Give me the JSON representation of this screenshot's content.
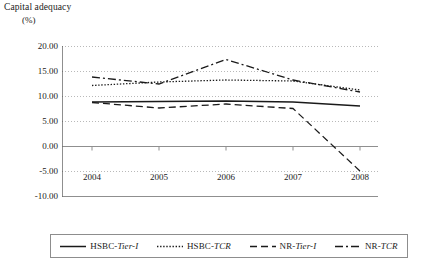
{
  "chart_data": {
    "type": "line",
    "title": "Capital adequacy",
    "subtitle": "(%)",
    "xlabel": "",
    "ylabel": "Capital adequacy (%)",
    "unit": "(%)",
    "categories": [
      "2004",
      "2005",
      "2006",
      "2007",
      "2008"
    ],
    "x": [
      2004,
      2005,
      2006,
      2007,
      2008
    ],
    "ylim": [
      -10.0,
      20.0
    ],
    "ytick_values": [
      20.0,
      15.0,
      10.0,
      5.0,
      0.0,
      -5.0,
      -10.0
    ],
    "ytick_labels": [
      "20.00",
      "15.00",
      "10.00",
      "5.00",
      "0.00",
      "-5.00",
      "-10.00"
    ],
    "grid": true,
    "grid_style": "dotted",
    "legend_position": "bottom",
    "series": [
      {
        "name": "HSBC-Tier-I",
        "name_prefix": "HSBC-",
        "name_italic": "Tier-I",
        "style": "solid",
        "color": "#1a1a1a",
        "values": [
          8.8,
          8.9,
          9.0,
          8.8,
          8.0
        ]
      },
      {
        "name": "HSBC-TCR",
        "name_prefix": "HSBC-",
        "name_italic": "TCR",
        "style": "dotted",
        "color": "#1a1a1a",
        "values": [
          12.1,
          12.8,
          13.2,
          13.0,
          11.2
        ]
      },
      {
        "name": "NR-Tier-I",
        "name_prefix": "NR-",
        "name_italic": "Tier-I",
        "style": "dashed",
        "color": "#1a1a1a",
        "values": [
          8.7,
          7.6,
          8.4,
          7.5,
          -5.0
        ]
      },
      {
        "name": "NR-TCR",
        "name_prefix": "NR-",
        "name_italic": "TCR",
        "style": "dashdot",
        "color": "#1a1a1a",
        "values": [
          13.8,
          12.4,
          17.3,
          13.2,
          10.8
        ]
      }
    ]
  },
  "legend": {
    "entries": [
      {
        "prefix": "HSBC-",
        "italic": "Tier-I",
        "style": "solid"
      },
      {
        "prefix": "HSBC-",
        "italic": "TCR",
        "style": "dotted"
      },
      {
        "prefix": "NR-",
        "italic": "Tier-I",
        "style": "dashed"
      },
      {
        "prefix": "NR-",
        "italic": "TCR",
        "style": "dashdot"
      }
    ]
  }
}
